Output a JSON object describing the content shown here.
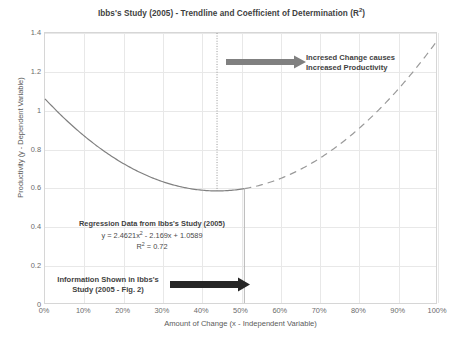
{
  "chart_data": {
    "type": "line",
    "title": "Ibbs's Study (2005) - Trendline and Coefficient of Determination (R2)",
    "title_main": "Ibbs's Study (2005) - Trendline and Coefficient of Determination (R",
    "title_sup": "2",
    "title_tail": ")",
    "xlabel": "Amount of Change (x - Independent Variable)",
    "ylabel": "Productivity (y - Dependent Variable)",
    "xlim": [
      0,
      100
    ],
    "ylim": [
      0,
      1.4
    ],
    "grid": true,
    "legend": "none",
    "x_ticks": [
      "0%",
      "10%",
      "20%",
      "30%",
      "40%",
      "50%",
      "60%",
      "70%",
      "80%",
      "90%",
      "100%"
    ],
    "x_tick_values": [
      0,
      10,
      20,
      30,
      40,
      50,
      60,
      70,
      80,
      90,
      100
    ],
    "y_ticks": [
      "0",
      "0.2",
      "0.4",
      "0.6",
      "0.8",
      "1",
      "1.2",
      "1.4"
    ],
    "y_tick_values": [
      0,
      0.2,
      0.4,
      0.6,
      0.8,
      1.0,
      1.2,
      1.4
    ],
    "equation": "y = 2.4621x2 - 2.169x + 1.0589",
    "coefficients": {
      "a": 2.4621,
      "b": -2.169,
      "c": 1.0589
    },
    "r_squared": 0.72,
    "series": [
      {
        "name": "Trendline (observed range - solid)",
        "style": "solid",
        "color": "#808080",
        "x_range": [
          0,
          51
        ],
        "x": [
          0,
          5,
          10,
          15,
          20,
          25,
          30,
          35,
          40,
          44,
          45,
          50,
          51
        ],
        "y": [
          1.0589,
          0.9566,
          0.8645,
          0.7826,
          0.711,
          0.6496,
          0.5984,
          0.5575,
          0.5268,
          0.5089,
          0.5064,
          0.4962,
          0.4956
        ]
      },
      {
        "name": "Trendline (extrapolated range - dashed)",
        "style": "dashed",
        "color": "#9a9a9a",
        "x_range": [
          51,
          100
        ],
        "x": [
          51,
          55,
          60,
          65,
          70,
          75,
          80,
          85,
          90,
          95,
          100
        ],
        "y": [
          0.4956,
          0.5071,
          0.5397,
          0.5826,
          0.6356,
          0.699,
          0.7725,
          0.8563,
          0.9504,
          1.0547,
          1.1693
        ]
      }
    ],
    "markers": {
      "dotted_vertical_line_x": 44,
      "dotted_vertical_line_label": "minimum-productivity-point",
      "solid_vertical_line_x": 51,
      "solid_vertical_line_label": "end-of-observed-data"
    },
    "annotations": [
      {
        "id": "increased-change",
        "lines": [
          "Incresed Change causes",
          "Increased Productivity"
        ],
        "arrow": "right",
        "arrow_color": "#808080",
        "x_start_pct": 47,
        "x_end_pct": 67,
        "y_value": 1.19
      },
      {
        "id": "regression-data",
        "lines": [
          "Regression Data from Ibbs's Study (2005)",
          "y = 2.4621x2 - 2.169x + 1.0589",
          "R2 = 0.72"
        ],
        "arrow": "none"
      },
      {
        "id": "information-shown",
        "lines": [
          "Information Shown in Ibbs's",
          "Study (2005 - Fig. 2)"
        ],
        "arrow": "right",
        "arrow_color": "#262626",
        "x_start_pct": 33,
        "x_end_pct": 52,
        "y_value": 0.12
      }
    ]
  },
  "annotations_text": {
    "top_line1": "Incresed Change causes",
    "top_line2": "Increased Productivity",
    "regression_heading": "Regression Data from Ibbs's Study (2005)",
    "regression_eq_prefix": "y = 2.4621x",
    "regression_eq_sup": "2",
    "regression_eq_suffix": " - 2.169x + 1.0589",
    "regression_r2_prefix": "R",
    "regression_r2_sup": "2",
    "regression_r2_suffix": " = 0.72",
    "bottom_line1": "Information Shown in Ibbs's",
    "bottom_line2": "Study (2005 - Fig. 2)"
  },
  "colors": {
    "curve_solid": "#808080",
    "curve_dashed": "#9a9a9a",
    "grid": "#e8e8e8",
    "frame": "#d6d6d6",
    "text": "#3f3f3f",
    "tick_text": "#6b6b6b",
    "arrow_gray": "#808080",
    "arrow_dark": "#262626"
  }
}
